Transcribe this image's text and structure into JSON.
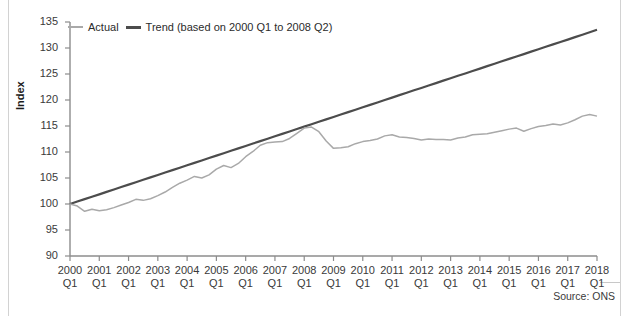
{
  "axes": {
    "ylabel": "Index",
    "yticks": [
      90,
      95,
      100,
      105,
      110,
      115,
      120,
      125,
      130,
      135
    ],
    "ylim": [
      90,
      135
    ],
    "xtick_years": [
      "2000",
      "2001",
      "2002",
      "2003",
      "2004",
      "2005",
      "2006",
      "2007",
      "2008",
      "2009",
      "2010",
      "2011",
      "2012",
      "2013",
      "2014",
      "2015",
      "2016",
      "2017",
      "2018"
    ],
    "xtick_quarter": "Q1"
  },
  "legend": {
    "actual_label": "Actual",
    "trend_label": "Trend (based on 2000 Q1 to 2008 Q2)"
  },
  "source": {
    "text": "Source: ONS"
  },
  "colors": {
    "actual": "#a9a9a9",
    "trend": "#4c4c4c",
    "axis": "#8c8c8c",
    "text": "#2b2b2b",
    "background": "#ffffff"
  },
  "chart_data": {
    "type": "line",
    "title": "",
    "xlabel": "",
    "ylabel": "Index",
    "ylim": [
      90,
      135
    ],
    "ytick_step": 5,
    "grid": false,
    "legend_position": "top-left",
    "x_start": "2000 Q1",
    "x_end": "2018 Q1",
    "x_frequency": "quarterly",
    "x": [
      "2000 Q1",
      "2000 Q2",
      "2000 Q3",
      "2000 Q4",
      "2001 Q1",
      "2001 Q2",
      "2001 Q3",
      "2001 Q4",
      "2002 Q1",
      "2002 Q2",
      "2002 Q3",
      "2002 Q4",
      "2003 Q1",
      "2003 Q2",
      "2003 Q3",
      "2003 Q4",
      "2004 Q1",
      "2004 Q2",
      "2004 Q3",
      "2004 Q4",
      "2005 Q1",
      "2005 Q2",
      "2005 Q3",
      "2005 Q4",
      "2006 Q1",
      "2006 Q2",
      "2006 Q3",
      "2006 Q4",
      "2007 Q1",
      "2007 Q2",
      "2007 Q3",
      "2007 Q4",
      "2008 Q1",
      "2008 Q2",
      "2008 Q3",
      "2008 Q4",
      "2009 Q1",
      "2009 Q2",
      "2009 Q3",
      "2009 Q4",
      "2010 Q1",
      "2010 Q2",
      "2010 Q3",
      "2010 Q4",
      "2011 Q1",
      "2011 Q2",
      "2011 Q3",
      "2011 Q4",
      "2012 Q1",
      "2012 Q2",
      "2012 Q3",
      "2012 Q4",
      "2013 Q1",
      "2013 Q2",
      "2013 Q3",
      "2013 Q4",
      "2014 Q1",
      "2014 Q2",
      "2014 Q3",
      "2014 Q4",
      "2015 Q1",
      "2015 Q2",
      "2015 Q3",
      "2015 Q4",
      "2016 Q1",
      "2016 Q2",
      "2016 Q3",
      "2016 Q4",
      "2017 Q1",
      "2017 Q2",
      "2017 Q3",
      "2017 Q4",
      "2018 Q1"
    ],
    "series": [
      {
        "name": "Actual",
        "color": "#a9a9a9",
        "values": [
          100.0,
          99.6,
          98.6,
          99.0,
          98.7,
          98.9,
          99.3,
          99.8,
          100.3,
          100.9,
          100.7,
          101.0,
          101.6,
          102.3,
          103.2,
          104.0,
          104.6,
          105.3,
          105.0,
          105.6,
          106.7,
          107.4,
          107.0,
          107.8,
          109.1,
          110.1,
          111.3,
          111.8,
          111.9,
          112.0,
          112.6,
          113.6,
          114.6,
          114.8,
          113.9,
          112.1,
          110.7,
          110.8,
          111.0,
          111.6,
          112.0,
          112.2,
          112.5,
          113.1,
          113.3,
          112.9,
          112.8,
          112.6,
          112.3,
          112.5,
          112.4,
          112.4,
          112.3,
          112.7,
          112.9,
          113.3,
          113.4,
          113.5,
          113.8,
          114.1,
          114.4,
          114.6,
          114.0,
          114.5,
          114.9,
          115.1,
          115.4,
          115.2,
          115.6,
          116.2,
          116.9,
          117.2,
          116.9
        ]
      },
      {
        "name": "Trend (based on 2000 Q1 to 2008 Q2)",
        "color": "#4c4c4c",
        "fit_from": "2000 Q1",
        "fit_to": "2008 Q2",
        "start_value": 100.0,
        "end_value": 133.5,
        "values": [
          100.0,
          100.47,
          100.93,
          101.4,
          101.86,
          102.33,
          102.79,
          103.26,
          103.72,
          104.19,
          104.65,
          105.12,
          105.58,
          106.05,
          106.51,
          106.98,
          107.44,
          107.91,
          108.37,
          108.84,
          109.3,
          109.77,
          110.23,
          110.7,
          111.16,
          111.63,
          112.09,
          112.56,
          113.02,
          113.49,
          113.95,
          114.42,
          114.88,
          115.35,
          115.81,
          116.28,
          116.74,
          117.21,
          117.67,
          118.14,
          118.6,
          119.07,
          119.53,
          120.0,
          120.46,
          120.93,
          121.39,
          121.86,
          122.32,
          122.79,
          123.25,
          123.72,
          124.18,
          124.65,
          125.11,
          125.58,
          126.04,
          126.51,
          126.97,
          127.44,
          127.9,
          128.37,
          128.83,
          129.3,
          129.76,
          130.23,
          130.69,
          131.16,
          131.62,
          132.09,
          132.55,
          133.02,
          133.5
        ]
      }
    ]
  }
}
